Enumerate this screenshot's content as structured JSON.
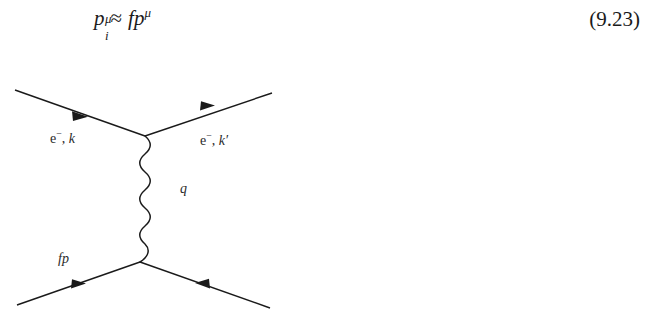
{
  "equation": {
    "base_symbol": "p",
    "subscript": "i",
    "superscript": "μ",
    "relation": "≈",
    "rhs_factor": "f",
    "rhs_symbol": "p",
    "rhs_superscript": "μ",
    "plain_text": "p_i^μ ≈ f p^μ",
    "number": "(9.23)"
  },
  "diagram": {
    "type": "feynman-diagram",
    "line_color": "#1a1a1a",
    "background": "#ffffff",
    "labels": {
      "upper_left": {
        "particle": "e",
        "charge": "−",
        "separator": ", ",
        "momentum": "k"
      },
      "upper_right": {
        "particle": "e",
        "charge": "−",
        "separator": ", ",
        "momentum": "k",
        "prime": "′"
      },
      "propagator": "q",
      "lower_left": "fp"
    },
    "vertices": {
      "top": {
        "x": 145,
        "y": 78
      },
      "bottom": {
        "x": 140,
        "y": 204
      }
    },
    "legs": [
      {
        "name": "incoming-electron-upper-left",
        "from": {
          "x": 15,
          "y": 32
        },
        "to": {
          "x": 145,
          "y": 78
        },
        "arrow_direction": "toward-vertex"
      },
      {
        "name": "outgoing-electron-upper-right",
        "from": {
          "x": 145,
          "y": 78
        },
        "to": {
          "x": 272,
          "y": 35
        },
        "arrow_direction": "away-from-vertex"
      },
      {
        "name": "incoming-fermion-lower-left",
        "from": {
          "x": 17,
          "y": 247
        },
        "to": {
          "x": 140,
          "y": 204
        },
        "arrow_direction": "toward-vertex"
      },
      {
        "name": "outgoing-fermion-lower-right",
        "from": {
          "x": 140,
          "y": 204
        },
        "to": {
          "x": 270,
          "y": 250
        },
        "arrow_direction": "away-from-vertex"
      }
    ],
    "propagator": {
      "name": "photon-propagator",
      "style": "wavy",
      "oscillations": 6,
      "amplitude": 7
    }
  }
}
